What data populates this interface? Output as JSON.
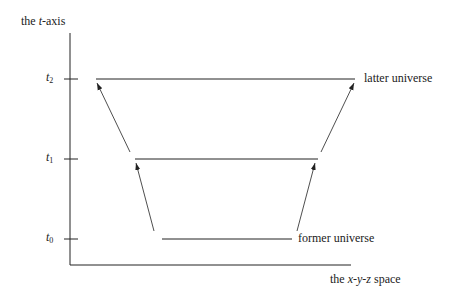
{
  "diagram": {
    "y_axis_label": {
      "prefix": "the ",
      "var": "t",
      "suffix": "-axis"
    },
    "x_axis_label": {
      "prefix": "the ",
      "x": "x",
      "y": "y",
      "z": "z",
      "suffix": " space"
    },
    "ticks": [
      {
        "var": "t",
        "sub": "2",
        "y": 79
      },
      {
        "var": "t",
        "sub": "1",
        "y": 159
      },
      {
        "var": "t",
        "sub": "0",
        "y": 239
      }
    ],
    "segments": [
      {
        "name": "latter-universe",
        "x1": 96,
        "x2": 355,
        "y": 79,
        "label": "latter universe"
      },
      {
        "name": "middle",
        "x1": 135,
        "x2": 318,
        "y": 159,
        "label": ""
      },
      {
        "name": "former-universe",
        "x1": 162,
        "x2": 292,
        "y": 239,
        "label": "former universe"
      }
    ],
    "arrows": [
      {
        "from": [
          154,
          231
        ],
        "to": [
          136,
          163
        ]
      },
      {
        "from": [
          297,
          231
        ],
        "to": [
          315,
          163
        ]
      },
      {
        "from": [
          130,
          152
        ],
        "to": [
          97,
          83
        ]
      },
      {
        "from": [
          321,
          152
        ],
        "to": [
          354,
          83
        ]
      }
    ],
    "colors": {
      "line": "#222222",
      "background": "#ffffff"
    }
  }
}
